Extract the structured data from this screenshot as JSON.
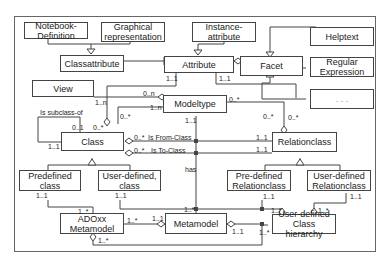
{
  "boxes": {
    "notebook_definition": "Notebook-\nDefinition",
    "graphical_representation": "Graphical\nrepresentation",
    "instance_attribute": "Instance-\nattribute",
    "helptext": "Helptext",
    "classattribute": "Classattribute",
    "attribute": "Attribute",
    "facet": "Facet",
    "regular_expression": "Regular\nExpression",
    "view": "View",
    "ellipsis": ". . .",
    "modeltype": "Modeltype",
    "class": "Class",
    "relationclass": "Relationclass",
    "predefined_class": "Predefined\nclass",
    "user_defined_class": "User-defined,\nclass",
    "predefined_relationclass": "Pre-defined\nRelationclass",
    "user_defined_relationclass": "User-defined\nRelationclass",
    "adoxx_metamodel": "ADOxx\nMetamodel",
    "metamodel": "Metamodel",
    "user_defined_class_hierarchy": "User-defined\nClass hierarchy"
  },
  "labels": {
    "attr_mt_1_1": "1..1",
    "attr_rc_1_1": "1..1",
    "view_1_n": "1..n",
    "mt_view_0_n": "0..n",
    "mt_class_1_n": "1..n",
    "mt_rc_0_many": "0..*",
    "is_subclass_of": "Is subclass-of",
    "sub_0_1": "0..1",
    "sub_1_1": "1..1",
    "class_attr_0_many": "0..*",
    "class_mt_0_many": "0..*",
    "from_class_0_many": "0..*",
    "is_from_class": "Is From-Class",
    "to_class_0_many": "0..*",
    "is_to_class": "Is To-Class",
    "mt_meta_1_1": "1..1",
    "rc_facet_0_many": "0..*",
    "rc_mt_0_many": "0..*",
    "from_rc_1_1": "1..1",
    "to_rc_1_1": "1..1",
    "has": "has",
    "pc_1_1": "1..1",
    "udc_1_1": "1..1",
    "prc_1_1": "1..1",
    "udrc_1_1": "1..1",
    "adoxx_1_many_top": "1..*",
    "adoxx_1_many_right": "1..*",
    "adoxx_1_many_bottom": "1..*",
    "meta_1_1_left": "1..1",
    "meta_1_many_top": "1..*",
    "meta_1_1_right": "1..1",
    "udch_1_many_left": "1..*",
    "udch_1_many_top": "1..*",
    "udch_1_1_bottom": "1..*"
  },
  "colors": {
    "line": "#444444",
    "frame": "#555555",
    "box_fill": "#ffffff"
  }
}
